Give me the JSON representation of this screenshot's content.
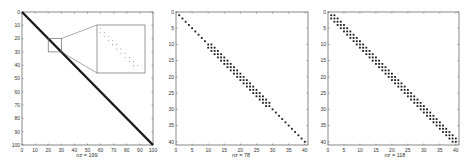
{
  "chart_data": [
    {
      "type": "scatter",
      "subtype": "sparsity-pattern",
      "title": "",
      "xlabel": "nz = 199",
      "ylabel": "",
      "matrix_size": 100,
      "pattern": "lower-bidiagonal",
      "nonzeros": 199,
      "xticks": [
        0,
        10,
        20,
        30,
        40,
        50,
        60,
        70,
        80,
        90,
        100
      ],
      "yticks": [
        0,
        10,
        20,
        30,
        40,
        50,
        60,
        70,
        80,
        90,
        100
      ],
      "xlim": [
        0,
        100
      ],
      "ylim": [
        100,
        0
      ],
      "inset": {
        "region": {
          "rows": [
            20,
            30
          ],
          "cols": [
            20,
            30
          ]
        },
        "description": "magnified view of diagonal and subdiagonal entries"
      }
    },
    {
      "type": "scatter",
      "subtype": "sparsity-pattern",
      "title": "",
      "xlabel": "nz = 78",
      "ylabel": "",
      "matrix_size": 41,
      "pattern": "diagonal with tridiagonal band in rows 10-29",
      "nonzeros": 78,
      "xticks": [
        0,
        5,
        10,
        15,
        20,
        25,
        30,
        35,
        40
      ],
      "yticks": [
        0,
        5,
        10,
        15,
        20,
        25,
        30,
        35,
        40
      ],
      "xlim": [
        0,
        41
      ],
      "ylim": [
        41,
        0
      ]
    },
    {
      "type": "scatter",
      "subtype": "sparsity-pattern",
      "title": "",
      "xlabel": "nz = 118",
      "ylabel": "",
      "matrix_size": 40,
      "pattern": "tridiagonal",
      "nonzeros": 118,
      "xticks": [
        0,
        5,
        10,
        15,
        20,
        25,
        30,
        35,
        40
      ],
      "yticks": [
        0,
        5,
        10,
        15,
        20,
        25,
        30,
        35,
        40
      ],
      "xlim": [
        0,
        41
      ],
      "ylim": [
        41,
        0
      ]
    }
  ],
  "labels": {
    "plot1_xlabel": "nz = 199",
    "plot2_xlabel": "nz = 78",
    "plot3_xlabel": "nz = 118"
  },
  "colors": {
    "marker": "#1a1a1a",
    "axis": "#555555",
    "background": "#ffffff"
  }
}
